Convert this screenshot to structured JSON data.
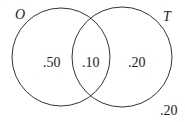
{
  "diagram": {
    "type": "venn",
    "sets": [
      {
        "name": "O",
        "only_value": ".50"
      },
      {
        "name": "T",
        "only_value": ".20"
      }
    ],
    "intersection_value": ".10",
    "outside_value": ".20",
    "colors": {
      "stroke": "#333333",
      "background": "#ffffff"
    }
  }
}
